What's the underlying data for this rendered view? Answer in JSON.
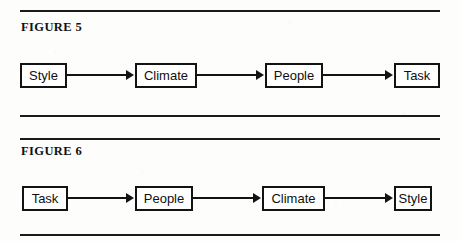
{
  "page": {
    "background_color": "#fdfdfc",
    "ink_color": "#131313"
  },
  "figures": [
    {
      "label": "FIGURE 5",
      "nodes": [
        "Style",
        "Climate",
        "People",
        "Task"
      ],
      "arrow_glyph": "▶",
      "flow": "Style -> Climate -> People -> Task"
    },
    {
      "label": "FIGURE 6",
      "nodes": [
        "Task",
        "People",
        "Climate",
        "Style"
      ],
      "arrow_glyph": "▶",
      "flow": "Task -> People -> Climate -> Style"
    }
  ]
}
